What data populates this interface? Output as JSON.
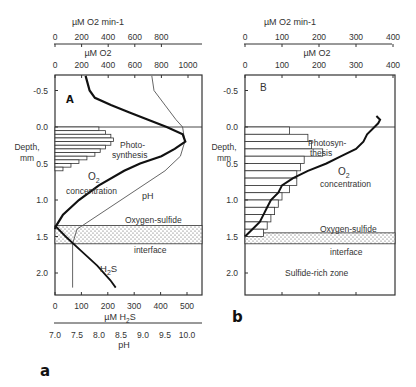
{
  "figure_labels": {
    "a": "a",
    "b": "b"
  },
  "chart_data": [
    {
      "type": "line",
      "panel": "A",
      "title": "A",
      "ylabel": "Depth, mm",
      "ylim": [
        2.2,
        -0.7
      ],
      "yticks": [
        "-0.5",
        "0.0",
        "0.5",
        "1.0",
        "1.5",
        "2.0"
      ],
      "top_axes": [
        {
          "label": "µM O2 min-1",
          "ticks": [
            "0",
            "200",
            "400",
            "600",
            "800"
          ]
        },
        {
          "label": "µM O2",
          "ticks": [
            "0",
            "200",
            "400",
            "600",
            "800",
            "1000"
          ]
        }
      ],
      "bottom_axes": [
        {
          "label": "µM H2S",
          "ticks": [
            "0",
            "100",
            "200",
            "300",
            "400",
            "500"
          ]
        },
        {
          "label": "pH",
          "ticks": [
            "7.0",
            "7.5",
            "8.0",
            "8.5",
            "9.0",
            "9.5",
            "10.0"
          ]
        }
      ],
      "annotations": [
        "Photo-",
        "synthesis",
        "O2",
        "concentration",
        "pH",
        "Oxygen-sulfide",
        "interface",
        "H2S"
      ],
      "interface_band": [
        1.35,
        1.6
      ],
      "series": [
        {
          "name": "Photosynthesis (µM O2 min-1)",
          "style": "bars",
          "depth": [
            0.0,
            0.05,
            0.1,
            0.15,
            0.2,
            0.25,
            0.3,
            0.35,
            0.4,
            0.45,
            0.5,
            0.55
          ],
          "values": [
            330,
            380,
            420,
            440,
            420,
            380,
            340,
            300,
            240,
            180,
            120,
            60
          ]
        },
        {
          "name": "O2 concentration (µM)",
          "style": "thick",
          "depth": [
            -0.7,
            -0.5,
            -0.4,
            -0.3,
            -0.2,
            -0.1,
            0.0,
            0.1,
            0.2,
            0.3,
            0.4,
            0.5,
            0.6,
            0.8,
            1.0,
            1.2,
            1.35,
            1.4
          ],
          "values": [
            230,
            260,
            300,
            420,
            560,
            700,
            840,
            960,
            980,
            900,
            800,
            640,
            520,
            330,
            180,
            60,
            10,
            0
          ]
        },
        {
          "name": "pH",
          "style": "thin",
          "depth": [
            -0.7,
            -0.5,
            -0.3,
            -0.1,
            0.0,
            0.2,
            0.4,
            0.6,
            0.8,
            1.0,
            1.2,
            1.4,
            1.6,
            2.0,
            2.2
          ],
          "values": [
            9.2,
            9.25,
            9.5,
            9.75,
            9.9,
            9.95,
            9.85,
            9.5,
            9.0,
            8.5,
            8.0,
            7.5,
            7.4,
            7.4,
            7.4
          ]
        },
        {
          "name": "H2S (µM)",
          "style": "thick",
          "depth": [
            1.35,
            1.5,
            1.7,
            1.9,
            2.1,
            2.2
          ],
          "values": [
            0,
            40,
            100,
            160,
            210,
            230
          ]
        }
      ]
    },
    {
      "type": "line",
      "panel": "B",
      "title": "B",
      "ylabel": "Depth, mm",
      "ylim": [
        2.2,
        -0.7
      ],
      "yticks": [
        "-0.5",
        "0.0",
        "0.5",
        "1.0",
        "1.5",
        "2.0"
      ],
      "top_axes": [
        {
          "label": "µM O2 min-1",
          "ticks": [
            "0",
            "100",
            "200",
            "300",
            "400"
          ]
        },
        {
          "label": "µM O2",
          "ticks": [
            "0",
            "100",
            "200",
            "300",
            "400"
          ]
        }
      ],
      "annotations": [
        "Photosyn-",
        "thesis",
        "O2",
        "concentration",
        "Oxygen-sulfide",
        "interface",
        "Sulfide-rich zone"
      ],
      "interface_band": [
        1.45,
        1.6
      ],
      "series": [
        {
          "name": "Photosynthesis (µM O2 min-1)",
          "style": "bars",
          "depth": [
            0.0,
            0.1,
            0.2,
            0.3,
            0.4,
            0.5,
            0.6,
            0.7,
            0.8,
            0.9,
            1.0,
            1.1,
            1.2,
            1.3,
            1.4
          ],
          "values": [
            120,
            170,
            180,
            210,
            160,
            150,
            140,
            140,
            120,
            100,
            90,
            80,
            70,
            60,
            50
          ]
        },
        {
          "name": "O2 concentration (µM)",
          "style": "thick",
          "depth": [
            -0.15,
            -0.1,
            -0.05,
            0.0,
            0.1,
            0.2,
            0.3,
            0.4,
            0.5,
            0.6,
            0.7,
            0.8,
            0.9,
            1.0,
            1.1,
            1.2,
            1.3,
            1.4,
            1.5
          ],
          "values": [
            355,
            365,
            360,
            350,
            330,
            320,
            300,
            260,
            220,
            170,
            130,
            100,
            90,
            70,
            60,
            50,
            40,
            20,
            0
          ]
        }
      ]
    }
  ]
}
